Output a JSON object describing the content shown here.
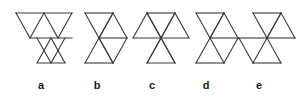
{
  "canvas": {
    "width": 299,
    "height": 100,
    "background": "#ffffff",
    "stroke_color": "#3a3a3a",
    "stroke_width": 1.1
  },
  "figure_set": {
    "description": "Five labelled line-drawing figures each composed of equilateral triangles joined at vertices and edges",
    "count": 5
  },
  "labels": [
    {
      "text": "a",
      "x": 41,
      "y": 79
    },
    {
      "text": "b",
      "x": 97,
      "y": 79
    },
    {
      "text": "c",
      "x": 152,
      "y": 79
    },
    {
      "text": "d",
      "x": 206,
      "y": 79
    },
    {
      "text": "e",
      "x": 259,
      "y": 79
    }
  ],
  "figures": [
    {
      "id": "a",
      "label": "a",
      "triangle_count": 5,
      "polylines": [
        "16,13 72,13",
        "16,13 30,38 44,13",
        "44,13 58,38 72,13",
        "30,38 72,38",
        "37,38 51,63 65,38",
        "37,63 65,63 51,38 37,63"
      ]
    },
    {
      "id": "b",
      "label": "b",
      "triangle_count": 4,
      "polylines": [
        "85,13 113,13",
        "85,13 99,38 113,13",
        "99,38 127,38",
        "99,38 113,13",
        "113,13 127,38",
        "99,38 113,63 127,38",
        "85,63 113,63",
        "85,63 99,38",
        "99,38 113,63"
      ]
    },
    {
      "id": "c",
      "label": "c",
      "triangle_count": 5,
      "polylines": [
        "133,38 161,38 147,13 133,38",
        "161,38 189,38 175,13 161,38",
        "147,13 175,13",
        "147,13 161,38 175,13",
        "147,63 175,63 161,38 147,63",
        "161,38 147,63",
        "161,38 175,63"
      ]
    },
    {
      "id": "d",
      "label": "d",
      "triangle_count": 4,
      "polylines": [
        "196,13 224,13",
        "196,13 210,38 224,13",
        "210,38 238,38",
        "210,38 224,13",
        "224,13 238,38",
        "196,63 224,63",
        "196,63 210,38",
        "210,38 224,63",
        "224,63 238,38"
      ]
    },
    {
      "id": "e",
      "label": "e",
      "triangle_count": 4,
      "polylines": [
        "253,13 281,13",
        "253,13 267,38 281,13",
        "267,38 295,38",
        "267,38 281,13",
        "281,13 295,38",
        "239,38 267,38",
        "239,38 253,63",
        "253,63 267,38",
        "253,63 281,63",
        "267,38 281,63"
      ]
    }
  ]
}
